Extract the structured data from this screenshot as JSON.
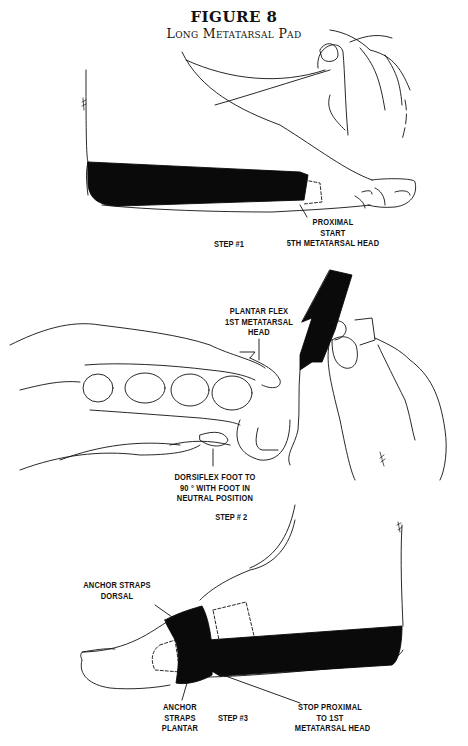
{
  "figure": {
    "number": "FIGURE 8",
    "title": "Long Metatarsal Pad"
  },
  "steps": [
    {
      "label": "STEP #1",
      "callouts": [
        {
          "lines": [
            "PROXIMAL",
            "START",
            "5TH METATARSAL HEAD"
          ]
        }
      ]
    },
    {
      "label": "STEP # 2",
      "callouts": [
        {
          "lines": [
            "PLANTAR FLEX",
            "1ST METATARSAL",
            "HEAD"
          ]
        },
        {
          "lines": [
            "DORSIFLEX FOOT TO",
            "90 ° WITH FOOT IN",
            "NEUTRAL POSITION"
          ]
        }
      ]
    },
    {
      "label": "STEP #3",
      "callouts": [
        {
          "lines": [
            "ANCHOR STRAPS",
            "DORSAL"
          ]
        },
        {
          "lines": [
            "ANCHOR",
            "STRAPS",
            "PLANTAR"
          ]
        },
        {
          "lines": [
            "STOP PROXIMAL",
            "TO 1ST",
            "METATARSAL HEAD"
          ]
        }
      ]
    }
  ],
  "colors": {
    "ink": "#111111",
    "tape": "#0a0a0a",
    "paper": "#ffffff"
  }
}
